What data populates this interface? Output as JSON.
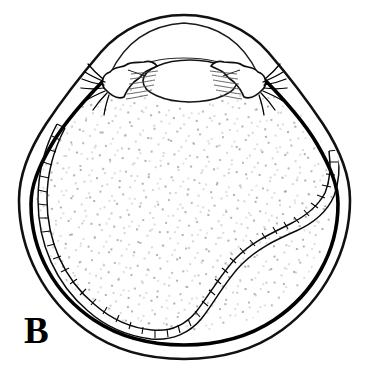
{
  "figure": {
    "panel_label": "B",
    "background_color": "#ffffff",
    "line_color": "#000000",
    "stipple_color": "#9a9a9a",
    "structures": [
      {
        "name": "sclera-outer-wall",
        "label": "sclera outer contour"
      },
      {
        "name": "sclera-inner-wall",
        "label": "sclera inner contour"
      },
      {
        "name": "cornea",
        "label": "cornea"
      },
      {
        "name": "anterior-chamber",
        "label": "anterior chamber"
      },
      {
        "name": "lens",
        "label": "lens"
      },
      {
        "name": "iris-left",
        "label": "iris / ciliary body left"
      },
      {
        "name": "iris-right",
        "label": "iris / ciliary body right"
      },
      {
        "name": "zonule-fibers-left",
        "label": "zonular fibers left"
      },
      {
        "name": "zonule-fibers-right",
        "label": "zonular fibers right"
      },
      {
        "name": "ciliary-processes-left",
        "label": "ciliary processes left"
      },
      {
        "name": "ciliary-processes-right",
        "label": "ciliary processes right"
      },
      {
        "name": "vitreous-body",
        "label": "vitreous body (stippled)"
      },
      {
        "name": "detached-retina-band",
        "label": "detached retina, segmented band"
      }
    ]
  }
}
